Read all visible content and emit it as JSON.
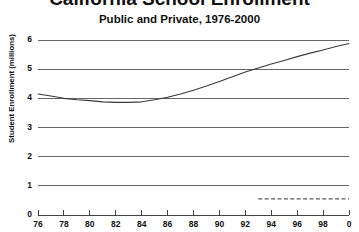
{
  "chart_data": {
    "type": "line",
    "title": "California School Enrollment",
    "subtitle": "Public and Private, 1976-2000",
    "xlabel": "",
    "ylabel": "Student Enrollment (millions)",
    "xlim": [
      1976,
      2000
    ],
    "ylim": [
      0,
      6
    ],
    "grid": true,
    "legend": "none",
    "y_ticks": [
      "0",
      "1",
      "2",
      "3",
      "4",
      "5",
      "6"
    ],
    "y_tick_values": [
      0,
      1,
      2,
      3,
      4,
      5,
      6
    ],
    "x_ticks": [
      "76",
      "78",
      "80",
      "82",
      "84",
      "86",
      "88",
      "90",
      "92",
      "94",
      "96",
      "98",
      "0"
    ],
    "x_tick_values": [
      1976,
      1978,
      1980,
      1982,
      1984,
      1986,
      1988,
      1990,
      1992,
      1994,
      1996,
      1998,
      2000
    ],
    "series": [
      {
        "name": "Public",
        "style": "solid",
        "color": "#3a3a3a",
        "x": [
          1976,
          1977,
          1978,
          1979,
          1980,
          1981,
          1982,
          1983,
          1984,
          1985,
          1986,
          1987,
          1988,
          1989,
          1990,
          1991,
          1992,
          1993,
          1994,
          1995,
          1996,
          1997,
          1998,
          1999,
          2000
        ],
        "values": [
          4.15,
          4.08,
          4.0,
          3.95,
          3.92,
          3.88,
          3.86,
          3.86,
          3.88,
          3.95,
          4.04,
          4.15,
          4.28,
          4.42,
          4.58,
          4.74,
          4.9,
          5.04,
          5.18,
          5.3,
          5.43,
          5.55,
          5.66,
          5.78,
          5.88
        ]
      },
      {
        "name": "Private",
        "style": "dashed",
        "color": "#5a5a5a",
        "x": [
          1993,
          1994,
          1995,
          1996,
          1997,
          1998,
          1999,
          2000
        ],
        "values": [
          0.55,
          0.55,
          0.55,
          0.55,
          0.55,
          0.55,
          0.55,
          0.55
        ]
      }
    ]
  }
}
